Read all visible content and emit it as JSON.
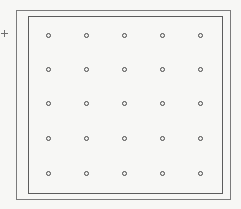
{
  "view": {
    "width": 241,
    "height": 209,
    "background_color": "#f7f7f5",
    "title": "Rectangular plate with 5x5 hole pattern"
  },
  "outer_frame": {
    "label": "outer boundary",
    "x": 16,
    "y": 10,
    "width": 215,
    "height": 190,
    "stroke_color": "#7b7b7b",
    "stroke_width": 1
  },
  "inner_frame": {
    "label": "inner boundary",
    "x": 28,
    "y": 16,
    "width": 195,
    "height": 178,
    "stroke_color": "#5c5c5c",
    "stroke_width": 1
  },
  "origin_marker": {
    "label": "origin cross marker",
    "x": 4,
    "y": 33,
    "stroke_color": "#6f6f6f"
  },
  "hole_pattern": {
    "label": "hole grid",
    "rows": 5,
    "columns": 5,
    "column_spacing": 38,
    "row_spacing": 34.5,
    "marker_diameter": 5,
    "stroke_color": "#4a4a4a",
    "fill_color": "#f2f2f0",
    "column_x": [
      48,
      86,
      124,
      162,
      200
    ],
    "row_y": [
      35,
      69,
      103,
      138,
      173
    ],
    "points": [
      {
        "col": 1,
        "row": 1,
        "x": 48,
        "y": 35
      },
      {
        "col": 2,
        "row": 1,
        "x": 86,
        "y": 35
      },
      {
        "col": 3,
        "row": 1,
        "x": 124,
        "y": 35
      },
      {
        "col": 4,
        "row": 1,
        "x": 162,
        "y": 35
      },
      {
        "col": 5,
        "row": 1,
        "x": 200,
        "y": 35
      },
      {
        "col": 1,
        "row": 2,
        "x": 48,
        "y": 69
      },
      {
        "col": 2,
        "row": 2,
        "x": 86,
        "y": 69
      },
      {
        "col": 3,
        "row": 2,
        "x": 124,
        "y": 69
      },
      {
        "col": 4,
        "row": 2,
        "x": 162,
        "y": 69
      },
      {
        "col": 5,
        "row": 2,
        "x": 200,
        "y": 69
      },
      {
        "col": 1,
        "row": 3,
        "x": 48,
        "y": 103
      },
      {
        "col": 2,
        "row": 3,
        "x": 86,
        "y": 103
      },
      {
        "col": 3,
        "row": 3,
        "x": 124,
        "y": 103
      },
      {
        "col": 4,
        "row": 3,
        "x": 162,
        "y": 103
      },
      {
        "col": 5,
        "row": 3,
        "x": 200,
        "y": 103
      },
      {
        "col": 1,
        "row": 4,
        "x": 48,
        "y": 138
      },
      {
        "col": 2,
        "row": 4,
        "x": 86,
        "y": 138
      },
      {
        "col": 3,
        "row": 4,
        "x": 124,
        "y": 138
      },
      {
        "col": 4,
        "row": 4,
        "x": 162,
        "y": 138
      },
      {
        "col": 5,
        "row": 4,
        "x": 200,
        "y": 138
      },
      {
        "col": 1,
        "row": 5,
        "x": 48,
        "y": 173
      },
      {
        "col": 2,
        "row": 5,
        "x": 86,
        "y": 173
      },
      {
        "col": 3,
        "row": 5,
        "x": 124,
        "y": 173
      },
      {
        "col": 4,
        "row": 5,
        "x": 162,
        "y": 173
      },
      {
        "col": 5,
        "row": 5,
        "x": 200,
        "y": 173
      }
    ]
  }
}
